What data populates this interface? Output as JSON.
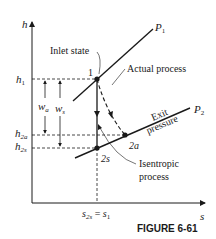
{
  "axes": {
    "y_label": "h",
    "x_label": "s"
  },
  "levels": {
    "h1": "h",
    "h1_sub": "1",
    "h2a": "h",
    "h2a_sub": "2a",
    "h2s": "h",
    "h2s_sub": "2s"
  },
  "work": {
    "wa": "w",
    "wa_sub": "a",
    "ws": "w",
    "ws_sub": "s"
  },
  "isobars": {
    "p1": "P",
    "p1_sub": "1",
    "p2": "P",
    "p2_sub": "2"
  },
  "states": {
    "s1": "1",
    "s2a": "2a",
    "s2s": "2s"
  },
  "annotations": {
    "inlet_state": "Inlet state",
    "actual_process": "Actual process",
    "exit_pressure_1": "Exit",
    "exit_pressure_2": "pressure",
    "isentropic_1": "Isentropic",
    "isentropic_2": "process"
  },
  "s_tick": {
    "left": "s",
    "left_sub": "2s",
    "eq": " = ",
    "right": "s",
    "right_sub": "1"
  },
  "figure_caption": "FIGURE 6-61"
}
